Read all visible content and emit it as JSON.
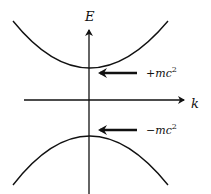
{
  "diagram": {
    "type": "energy-momentum dispersion",
    "axes": {
      "vertical_label": "E",
      "horizontal_label": "k"
    },
    "curves": [
      {
        "name": "positive-energy-branch",
        "shape": "upward parabola",
        "vertex_label": "+mc²"
      },
      {
        "name": "negative-energy-branch",
        "shape": "downward parabola",
        "vertex_label": "−mc²"
      }
    ],
    "annotations": {
      "upper": {
        "base": "+mc",
        "sup": "2"
      },
      "lower": {
        "base": "−mc",
        "sup": "2"
      }
    },
    "colors": {
      "stroke": "#111111",
      "background": "#ffffff"
    }
  }
}
